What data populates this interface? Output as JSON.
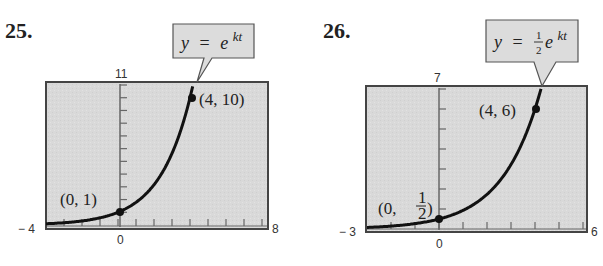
{
  "chart_data": [
    {
      "type": "line",
      "problem_number": "25.",
      "equation_label": "y = e^{kt}",
      "xlim": [
        -4,
        8
      ],
      "ylim": [
        0,
        11
      ],
      "x_tick_labels": [
        "-4",
        "0",
        "8"
      ],
      "y_tick_labels": [
        "11"
      ],
      "x_tick_step": 1,
      "y_tick_step": 1,
      "points": [
        {
          "x": 0,
          "y": 1,
          "label": "(0, 1)"
        },
        {
          "x": 4,
          "y": 10,
          "label": "(4, 10)"
        }
      ],
      "curve": {
        "a": 1,
        "k": 0.5756
      },
      "grid": false
    },
    {
      "type": "line",
      "problem_number": "26.",
      "equation_label": "y = (1/2)e^{kt}",
      "xlim": [
        -3,
        6
      ],
      "ylim": [
        0,
        7
      ],
      "x_tick_labels": [
        "-3",
        "0",
        "6"
      ],
      "y_tick_labels": [
        "7"
      ],
      "x_tick_step": 1,
      "y_tick_step": 1,
      "points": [
        {
          "x": 0,
          "y": 0.5,
          "label": "(0, 1/2)"
        },
        {
          "x": 4,
          "y": 6,
          "label": "(4, 6)"
        }
      ],
      "curve": {
        "a": 0.5,
        "k": 0.6212
      },
      "grid": false
    }
  ],
  "labels": {
    "p25": {
      "number": "25.",
      "eq_y": "y",
      "eq_equals": "=",
      "eq_e": "e",
      "eq_exp": "kt",
      "xmin": "− 4",
      "xzero": "0",
      "xmax": "8",
      "ymax": "11",
      "pt1": "(0,  1)",
      "pt2": "(4,  10)"
    },
    "p26": {
      "number": "26.",
      "eq_y": "y",
      "eq_equals": "=",
      "eq_frac_num": "1",
      "eq_frac_den": "2",
      "eq_e": "e",
      "eq_exp": "kt",
      "xmin": "− 3",
      "xzero": "0",
      "xmax": "6",
      "ymax": "7",
      "pt1_open": "(0,",
      "pt1_num": "1",
      "pt1_den": "2",
      "pt1_close": ")",
      "pt2": "(4,  6)"
    }
  }
}
